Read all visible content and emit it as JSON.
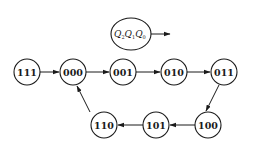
{
  "diagram": {
    "type": "state-diagram",
    "legend": {
      "label_parts": [
        {
          "text": "Q",
          "sub": "2"
        },
        {
          "text": "Q",
          "sub": "1"
        },
        {
          "text": "Q",
          "sub": "0"
        }
      ],
      "text": "Q2Q1Q0"
    },
    "nodes": [
      {
        "id": "111",
        "label": "111"
      },
      {
        "id": "000",
        "label": "000"
      },
      {
        "id": "001",
        "label": "001"
      },
      {
        "id": "010",
        "label": "010"
      },
      {
        "id": "011",
        "label": "011"
      },
      {
        "id": "100",
        "label": "100"
      },
      {
        "id": "101",
        "label": "101"
      },
      {
        "id": "110",
        "label": "110"
      }
    ],
    "edges": [
      {
        "from": "111",
        "to": "000"
      },
      {
        "from": "000",
        "to": "001"
      },
      {
        "from": "001",
        "to": "010"
      },
      {
        "from": "010",
        "to": "011"
      },
      {
        "from": "011",
        "to": "100"
      },
      {
        "from": "100",
        "to": "101"
      },
      {
        "from": "101",
        "to": "110"
      },
      {
        "from": "110",
        "to": "000"
      }
    ],
    "colors": {
      "stroke": "#1a1a1a",
      "background": "#ffffff"
    }
  }
}
